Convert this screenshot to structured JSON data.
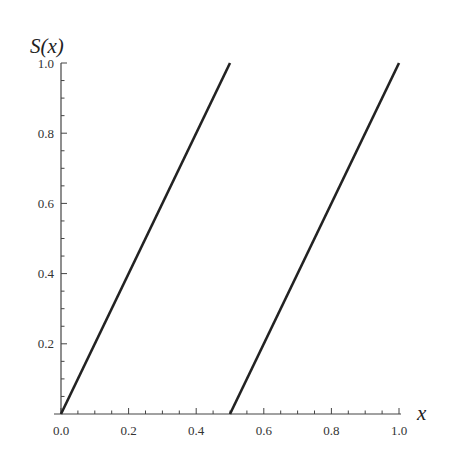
{
  "chart_data": {
    "type": "line",
    "title": "",
    "xlabel": "x",
    "ylabel": "S(x)",
    "xlim": [
      0.0,
      1.0
    ],
    "ylim": [
      0.0,
      1.0
    ],
    "x_ticks": [
      "0.0",
      "0.2",
      "0.4",
      "0.6",
      "0.8",
      "1.0"
    ],
    "y_ticks": [
      "0.2",
      "0.4",
      "0.6",
      "0.8",
      "1.0"
    ],
    "grid": false,
    "legend": null,
    "series": [
      {
        "name": "segment-1",
        "x": [
          0.0,
          0.5
        ],
        "y": [
          0.0,
          1.0
        ]
      },
      {
        "name": "segment-2",
        "x": [
          0.5,
          1.0
        ],
        "y": [
          0.0,
          1.0
        ]
      }
    ],
    "colors": {
      "line": "#222222",
      "axis": "#444444"
    }
  }
}
